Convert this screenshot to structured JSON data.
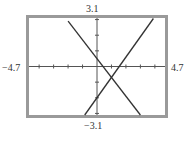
{
  "chart_data": {
    "type": "line",
    "title": "",
    "xlabel": "",
    "ylabel": "",
    "xlim": [
      -4.7,
      4.7
    ],
    "ylim": [
      -3.1,
      3.1
    ],
    "x_ticks": [
      -4,
      -3,
      -2,
      -1,
      1,
      2,
      3,
      4
    ],
    "y_ticks": [
      -3,
      -2,
      -1,
      1,
      2,
      3
    ],
    "grid": false,
    "window_labels": {
      "xmin": "-4.7",
      "xmax": "4.7",
      "ymin": "-3.1",
      "ymax": "3.1"
    },
    "series": [
      {
        "name": "decreasing line",
        "equation": "y = -1.2x + 0.5",
        "x": [
          -2.0,
          3.0
        ],
        "y": [
          2.9,
          -3.1
        ]
      },
      {
        "name": "increasing line",
        "equation": "y = 1.3x - 2",
        "x": [
          -0.85,
          3.9
        ],
        "y": [
          -3.1,
          3.07
        ]
      }
    ],
    "annotations": [
      {
        "type": "intersection",
        "x": 1.0,
        "y": -0.7
      }
    ]
  },
  "colors": {
    "frame": "#9a9a9a",
    "axis": "#555555",
    "line": "#333333"
  }
}
